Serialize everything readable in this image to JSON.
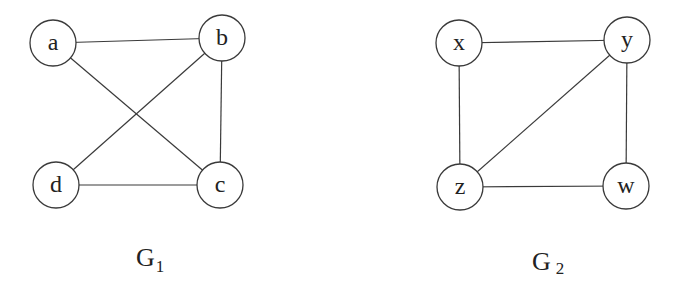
{
  "graphs": [
    {
      "name": "G",
      "subscript": "1",
      "nodes": [
        {
          "id": "a",
          "label": "a",
          "x": 53,
          "y": 43
        },
        {
          "id": "b",
          "label": "b",
          "x": 222,
          "y": 38
        },
        {
          "id": "d",
          "label": "d",
          "x": 56,
          "y": 185
        },
        {
          "id": "c",
          "label": "c",
          "x": 220,
          "y": 185
        }
      ],
      "edges": [
        [
          "a",
          "b"
        ],
        [
          "a",
          "c"
        ],
        [
          "b",
          "d"
        ],
        [
          "b",
          "c"
        ],
        [
          "d",
          "c"
        ]
      ]
    },
    {
      "name": "G",
      "subscript": "2",
      "nodes": [
        {
          "id": "x",
          "label": "x",
          "x": 459,
          "y": 43
        },
        {
          "id": "y",
          "label": "y",
          "x": 627,
          "y": 40
        },
        {
          "id": "z",
          "label": "z",
          "x": 460,
          "y": 187
        },
        {
          "id": "w",
          "label": "w",
          "x": 626,
          "y": 186
        }
      ],
      "edges": [
        [
          "x",
          "y"
        ],
        [
          "x",
          "z"
        ],
        [
          "y",
          "z"
        ],
        [
          "y",
          "w"
        ],
        [
          "z",
          "w"
        ]
      ]
    }
  ],
  "node_radius": 23
}
